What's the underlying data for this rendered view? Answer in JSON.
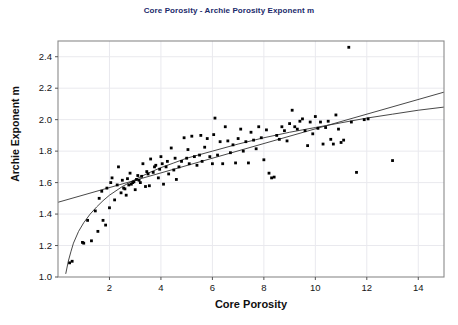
{
  "chart_data": {
    "type": "scatter",
    "title": "Core Porosity - Archie Porosity Exponent m",
    "xlabel": "Core Porosity",
    "ylabel": "Archie Exponent m",
    "xlim": [
      0,
      15
    ],
    "ylim": [
      1.0,
      2.5
    ],
    "xticks": [
      2,
      4,
      6,
      8,
      10,
      12,
      14
    ],
    "yticks": [
      "1.0",
      "1.2",
      "1.4",
      "1.6",
      "1.8",
      "2.0",
      "2.2",
      "2.4"
    ],
    "grid": true,
    "legend": "none",
    "marker_color": "#000000",
    "trendline_color": "#333333",
    "points": [
      [
        0.45,
        1.09
      ],
      [
        0.55,
        1.1
      ],
      [
        0.95,
        1.22
      ],
      [
        1.0,
        1.215
      ],
      [
        1.15,
        1.36
      ],
      [
        1.3,
        1.23
      ],
      [
        1.45,
        1.42
      ],
      [
        1.55,
        1.29
      ],
      [
        1.6,
        1.5
      ],
      [
        1.7,
        1.545
      ],
      [
        1.75,
        1.36
      ],
      [
        1.85,
        1.33
      ],
      [
        1.9,
        1.565
      ],
      [
        2.0,
        1.44
      ],
      [
        2.05,
        1.6
      ],
      [
        2.1,
        1.63
      ],
      [
        2.2,
        1.49
      ],
      [
        2.3,
        1.585
      ],
      [
        2.35,
        1.7
      ],
      [
        2.45,
        1.535
      ],
      [
        2.5,
        1.615
      ],
      [
        2.55,
        1.565
      ],
      [
        2.6,
        1.56
      ],
      [
        2.65,
        1.52
      ],
      [
        2.7,
        1.625
      ],
      [
        2.75,
        1.585
      ],
      [
        2.8,
        1.66
      ],
      [
        2.85,
        1.59
      ],
      [
        2.9,
        1.6
      ],
      [
        2.95,
        1.605
      ],
      [
        3.0,
        1.555
      ],
      [
        3.05,
        1.62
      ],
      [
        3.1,
        1.645
      ],
      [
        3.15,
        1.615
      ],
      [
        3.2,
        1.6
      ],
      [
        3.25,
        1.64
      ],
      [
        3.3,
        1.72
      ],
      [
        3.4,
        1.575
      ],
      [
        3.45,
        1.67
      ],
      [
        3.5,
        1.655
      ],
      [
        3.55,
        1.58
      ],
      [
        3.6,
        1.75
      ],
      [
        3.7,
        1.665
      ],
      [
        3.75,
        1.7
      ],
      [
        3.8,
        1.71
      ],
      [
        3.9,
        1.63
      ],
      [
        3.95,
        1.685
      ],
      [
        4.0,
        1.765
      ],
      [
        4.05,
        1.72
      ],
      [
        4.1,
        1.59
      ],
      [
        4.2,
        1.7
      ],
      [
        4.25,
        1.735
      ],
      [
        4.3,
        1.655
      ],
      [
        4.4,
        1.82
      ],
      [
        4.5,
        1.68
      ],
      [
        4.55,
        1.755
      ],
      [
        4.6,
        1.62
      ],
      [
        4.7,
        1.7
      ],
      [
        4.8,
        1.735
      ],
      [
        4.9,
        1.885
      ],
      [
        5.0,
        1.755
      ],
      [
        5.05,
        1.81
      ],
      [
        5.1,
        1.72
      ],
      [
        5.2,
        1.895
      ],
      [
        5.3,
        1.765
      ],
      [
        5.4,
        1.71
      ],
      [
        5.5,
        1.775
      ],
      [
        5.55,
        1.9
      ],
      [
        5.6,
        1.735
      ],
      [
        5.7,
        1.825
      ],
      [
        5.8,
        1.88
      ],
      [
        5.9,
        1.765
      ],
      [
        6.0,
        1.72
      ],
      [
        6.05,
        1.905
      ],
      [
        6.1,
        2.01
      ],
      [
        6.2,
        1.775
      ],
      [
        6.3,
        1.86
      ],
      [
        6.4,
        1.72
      ],
      [
        6.5,
        1.955
      ],
      [
        6.6,
        1.865
      ],
      [
        6.7,
        1.79
      ],
      [
        6.8,
        1.84
      ],
      [
        6.9,
        1.725
      ],
      [
        7.0,
        1.88
      ],
      [
        7.1,
        1.94
      ],
      [
        7.2,
        1.8
      ],
      [
        7.3,
        1.86
      ],
      [
        7.4,
        1.725
      ],
      [
        7.5,
        1.92
      ],
      [
        7.6,
        1.87
      ],
      [
        7.7,
        1.815
      ],
      [
        7.8,
        1.955
      ],
      [
        7.9,
        1.885
      ],
      [
        8.0,
        1.745
      ],
      [
        8.1,
        1.935
      ],
      [
        8.2,
        1.66
      ],
      [
        8.3,
        1.63
      ],
      [
        8.4,
        1.635
      ],
      [
        8.5,
        1.9
      ],
      [
        8.6,
        1.875
      ],
      [
        8.7,
        1.955
      ],
      [
        8.8,
        1.93
      ],
      [
        8.9,
        1.865
      ],
      [
        9.0,
        1.975
      ],
      [
        9.1,
        2.06
      ],
      [
        9.2,
        1.955
      ],
      [
        9.3,
        1.94
      ],
      [
        9.4,
        1.99
      ],
      [
        9.5,
        2.005
      ],
      [
        9.6,
        1.93
      ],
      [
        9.7,
        1.835
      ],
      [
        9.8,
        1.985
      ],
      [
        9.9,
        1.91
      ],
      [
        10.0,
        2.02
      ],
      [
        10.1,
        1.945
      ],
      [
        10.2,
        1.985
      ],
      [
        10.3,
        1.845
      ],
      [
        10.4,
        1.95
      ],
      [
        10.5,
        1.99
      ],
      [
        10.6,
        1.875
      ],
      [
        10.7,
        1.845
      ],
      [
        10.8,
        2.03
      ],
      [
        10.9,
        1.94
      ],
      [
        11.0,
        1.855
      ],
      [
        11.1,
        1.87
      ],
      [
        11.3,
        2.46
      ],
      [
        11.4,
        1.985
      ],
      [
        11.6,
        1.665
      ],
      [
        11.9,
        2.0
      ],
      [
        12.05,
        2.005
      ],
      [
        13.0,
        1.74
      ]
    ],
    "trendlines": [
      {
        "name": "linear-fit",
        "kind": "linear",
        "points": [
          [
            0.0,
            1.475
          ],
          [
            15.0,
            2.175
          ]
        ]
      },
      {
        "name": "log-fit",
        "kind": "logarithmic",
        "points": [
          [
            0.3,
            1.02
          ],
          [
            0.4,
            1.1
          ],
          [
            0.5,
            1.16
          ],
          [
            0.6,
            1.215
          ],
          [
            0.8,
            1.29
          ],
          [
            1.0,
            1.345
          ],
          [
            1.25,
            1.4
          ],
          [
            1.5,
            1.445
          ],
          [
            1.75,
            1.485
          ],
          [
            2.0,
            1.52
          ],
          [
            2.5,
            1.575
          ],
          [
            3.0,
            1.62
          ],
          [
            3.5,
            1.66
          ],
          [
            4.0,
            1.695
          ],
          [
            4.5,
            1.725
          ],
          [
            5.0,
            1.755
          ],
          [
            6.0,
            1.8
          ],
          [
            7.0,
            1.845
          ],
          [
            8.0,
            1.885
          ],
          [
            9.0,
            1.92
          ],
          [
            10.0,
            1.95
          ],
          [
            11.0,
            1.98
          ],
          [
            12.0,
            2.01
          ],
          [
            13.0,
            2.035
          ],
          [
            14.0,
            2.06
          ],
          [
            15.0,
            2.08
          ]
        ]
      }
    ]
  }
}
